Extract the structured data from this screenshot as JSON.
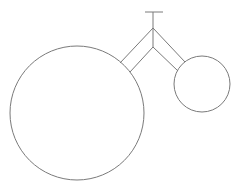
{
  "diagram": {
    "stroke_color": "#7a7a7a",
    "background": "#ffffff",
    "shapes": [
      {
        "name": "large-circle",
        "type": "circle",
        "cx": 77,
        "cy": 113,
        "r": 67
      },
      {
        "name": "small-circle",
        "type": "circle",
        "cx": 202,
        "cy": 84,
        "r": 28
      },
      {
        "name": "t-top-bar",
        "type": "line"
      },
      {
        "name": "t-stem",
        "type": "line"
      },
      {
        "name": "v-connector",
        "type": "double-line"
      }
    ]
  }
}
